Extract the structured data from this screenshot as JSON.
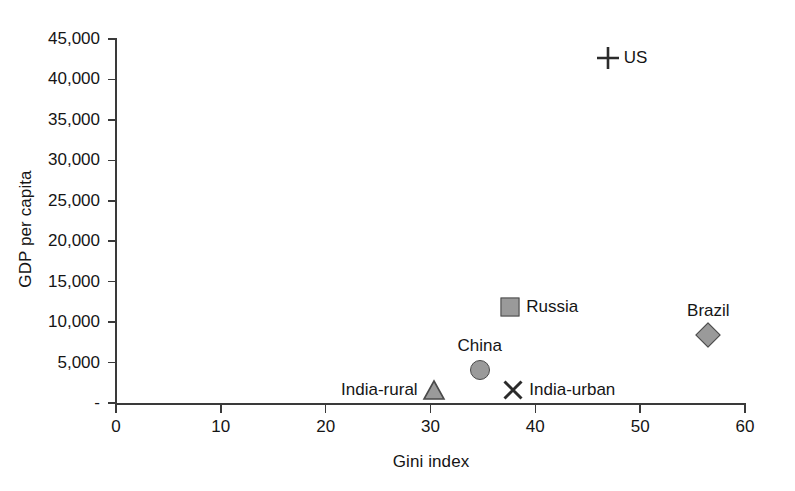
{
  "chart_data": {
    "type": "scatter",
    "title": "",
    "xlabel": "Gini index",
    "ylabel": "GDP per capita",
    "xlim": [
      0,
      60
    ],
    "ylim": [
      0,
      45000
    ],
    "grid": false,
    "legend": "none (point labels)",
    "x_ticks": [
      "0",
      "10",
      "20",
      "30",
      "40",
      "50",
      "60"
    ],
    "x_tick_values": [
      0,
      10,
      20,
      30,
      40,
      50,
      60
    ],
    "y_ticks": [
      "-",
      "5,000",
      "10,000",
      "15,000",
      "20,000",
      "25,000",
      "30,000",
      "35,000",
      "40,000",
      "45,000"
    ],
    "y_tick_values": [
      0,
      5000,
      10000,
      15000,
      20000,
      25000,
      30000,
      35000,
      40000,
      45000
    ],
    "points": [
      {
        "name": "US",
        "label": "US",
        "x": 46.9,
        "y": 42600,
        "marker": "plus",
        "label_position": "right"
      },
      {
        "name": "Russia",
        "label": "Russia",
        "x": 37.6,
        "y": 11900,
        "marker": "square",
        "label_position": "right"
      },
      {
        "name": "Brazil",
        "label": "Brazil",
        "x": 56.5,
        "y": 8400,
        "marker": "diamond",
        "label_position": "above"
      },
      {
        "name": "China",
        "label": "China",
        "x": 34.7,
        "y": 4100,
        "marker": "circle",
        "label_position": "above"
      },
      {
        "name": "India-rural",
        "label": "India-rural",
        "x": 30.3,
        "y": 1600,
        "marker": "triangle",
        "label_position": "left"
      },
      {
        "name": "India-urban",
        "label": "India-urban",
        "x": 37.9,
        "y": 1600,
        "marker": "cross",
        "label_position": "right"
      }
    ],
    "colors": {
      "marker_fill": "#9a9a9a",
      "marker_stroke": "#4a4a4a",
      "axis": "#3a3a3a",
      "text": "#151515",
      "background": "#ffffff"
    }
  },
  "plot_geometry": {
    "x_px_min": 116,
    "x_px_max": 745,
    "y_px_zero": 403,
    "y_px_max": 39
  }
}
